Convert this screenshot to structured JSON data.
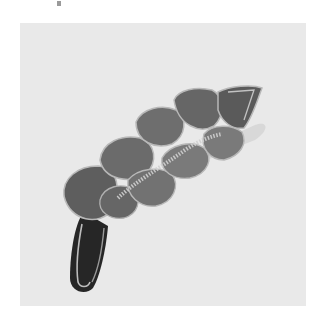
{
  "image": {
    "subject": "grey felt leaf-shaped applique with overlapping scale-like segments and a dark stem",
    "background_color": "#e9e9e9",
    "page_color": "#ffffff",
    "colors": {
      "scale_fill": "#707070",
      "scale_dark": "#555555",
      "scale_edge": "#b8b8b8",
      "stem_fill": "#262626",
      "stem_edge": "#bdbdbd",
      "sparkle": "#cfcfcf",
      "shadow": "#cdcdcd"
    }
  }
}
